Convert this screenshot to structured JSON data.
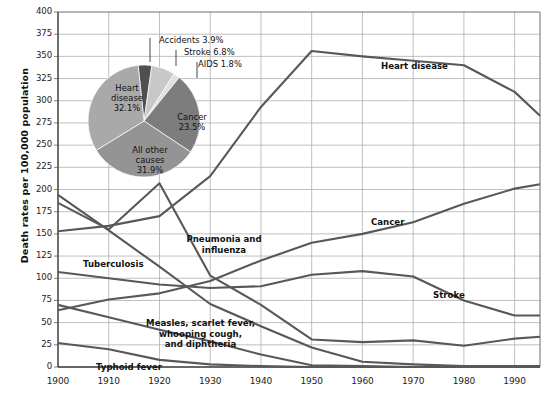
{
  "chart_data": {
    "type": "line",
    "title": "",
    "xlabel": "",
    "ylabel": "Death rates per 100,000 population",
    "xlim": [
      1900,
      1995
    ],
    "ylim": [
      0,
      400
    ],
    "ytick_step": 25,
    "grid": true,
    "legend": "inline-annotations",
    "yticks": [
      "400",
      "375",
      "350",
      "325",
      "300",
      "275",
      "250",
      "225",
      "200",
      "175",
      "150",
      "125",
      "100",
      "75",
      "50",
      "25",
      "0"
    ],
    "xticks": [
      "1900",
      "1910",
      "1920",
      "1930",
      "1940",
      "1950",
      "1960",
      "1970",
      "1980",
      "1990"
    ],
    "x": [
      1900,
      1910,
      1920,
      1930,
      1940,
      1950,
      1960,
      1970,
      1980,
      1990,
      1995
    ],
    "series": [
      {
        "name": "Heart disease",
        "label": "Heart disease",
        "values": [
          153,
          159,
          170,
          215,
          293,
          356,
          350,
          345,
          340,
          310,
          283
        ]
      },
      {
        "name": "Cancer",
        "label": "Cancer",
        "values": [
          64,
          76,
          83,
          97,
          120,
          140,
          150,
          163,
          184,
          201,
          206
        ]
      },
      {
        "name": "Stroke",
        "label": "Stroke",
        "values": [
          107,
          100,
          93,
          89,
          91,
          104,
          108,
          102,
          75,
          58,
          58
        ]
      },
      {
        "name": "Pneumonia and influenza",
        "label": "Pneumonia and influenza",
        "values": [
          185,
          155,
          207,
          103,
          70,
          31,
          28,
          30,
          24,
          32,
          34
        ]
      },
      {
        "name": "Tuberculosis",
        "label": "Tuberculosis",
        "values": [
          194,
          154,
          113,
          71,
          46,
          22,
          6,
          3,
          1,
          1,
          1
        ]
      },
      {
        "name": "Measles, scarlet fever, whooping cough, and diphtheria",
        "label": "Measles, scarlet fever, whooping cough, and diphtheria",
        "values": [
          70,
          56,
          42,
          29,
          14,
          2,
          1,
          0,
          0,
          0,
          0
        ]
      },
      {
        "name": "Typhoid fever",
        "label": "Typhoid fever",
        "values": [
          27,
          20,
          8,
          3,
          1,
          0,
          0,
          0,
          0,
          0,
          0
        ]
      }
    ]
  },
  "pie_chart": {
    "type": "pie",
    "title": "",
    "slices": [
      {
        "label": "Heart disease",
        "percent": "32.1%",
        "value": 32.1,
        "color": "#a9a9a9"
      },
      {
        "label": "Cancer",
        "percent": "23.5%",
        "value": 23.5,
        "color": "#7d7d7d"
      },
      {
        "label": "All other causes",
        "percent": "31.9%",
        "value": 31.9,
        "color": "#949494"
      },
      {
        "label": "Accidents",
        "percent": "3.9%",
        "value": 3.9,
        "color": "#4f4f4f"
      },
      {
        "label": "Stroke",
        "percent": "6.8%",
        "value": 6.8,
        "color": "#c8c8c8"
      },
      {
        "label": "AIDS",
        "percent": "1.8%",
        "value": 1.8,
        "color": "#e0e0e0"
      }
    ],
    "callouts": [
      {
        "text": "Accidents 3.9%"
      },
      {
        "text": "Stroke 6.8%"
      },
      {
        "text": "AIDS 1.8%"
      }
    ],
    "inside_labels": [
      {
        "line1": "Heart",
        "line2": "disease",
        "line3": "32.1%"
      },
      {
        "line1": "Cancer",
        "line2": "23.5%",
        "line3": ""
      },
      {
        "line1": "All other",
        "line2": "causes",
        "line3": "31.9%"
      }
    ]
  },
  "colors": {
    "line": "#585858",
    "grid": "#b0b0b0",
    "axis": "#6f6f6f",
    "text": "#111111"
  }
}
